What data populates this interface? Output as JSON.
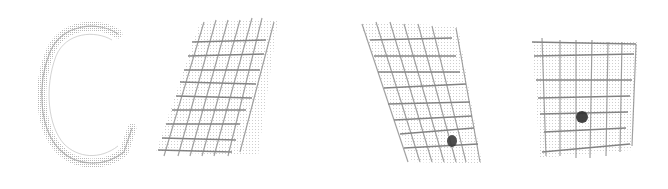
{
  "figure": {
    "background": "#ffffff",
    "ink_color": "#555555",
    "light_ink": "#9a9a9a",
    "marker_color": "#333333",
    "elements": [
      {
        "id": "c-band",
        "type": "c-shaped-band"
      },
      {
        "id": "mesh-1",
        "type": "sheared-grid",
        "marker": false
      },
      {
        "id": "mesh-2",
        "type": "sheared-grid",
        "marker": true
      },
      {
        "id": "mesh-3",
        "type": "square-grid",
        "marker": true
      }
    ]
  }
}
